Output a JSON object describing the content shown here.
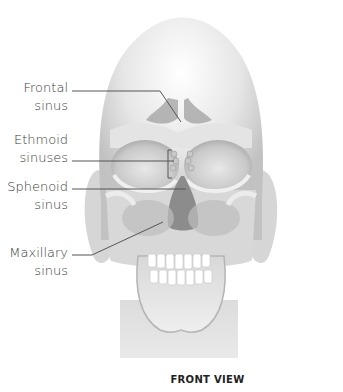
{
  "diagram": {
    "caption": "FRONT VIEW",
    "labels": [
      {
        "id": "frontal",
        "line1": "Frontal",
        "line2": "sinus"
      },
      {
        "id": "ethmoid",
        "line1": "Ethmoid",
        "line2": "sinuses"
      },
      {
        "id": "sphenoid",
        "line1": "Sphenoid",
        "line2": "sinus"
      },
      {
        "id": "maxillary",
        "line1": "Maxillary",
        "line2": "sinus"
      }
    ],
    "colors": {
      "bone_light": "#f2f2f2",
      "bone_mid": "#d4d4d4",
      "bone_dark": "#a8a8a8",
      "cavity": "#8c8c8c",
      "leader_line": "#555555",
      "text": "#3a3a3a"
    }
  }
}
